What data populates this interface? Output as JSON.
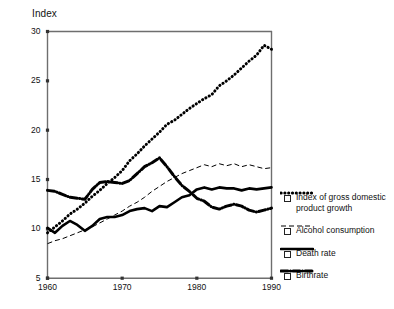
{
  "chart_data": {
    "type": "line",
    "title": "",
    "ylabel": "Index",
    "xlabel": "",
    "ylim": [
      5,
      30
    ],
    "xlim": [
      1960,
      1990
    ],
    "grid": false,
    "legend_position": "right-outside",
    "yticks": [
      5,
      10,
      15,
      20,
      25,
      30
    ],
    "xticks": [
      1960,
      1970,
      1980,
      1990
    ],
    "x": [
      1960,
      1961,
      1962,
      1963,
      1964,
      1965,
      1966,
      1967,
      1968,
      1969,
      1970,
      1971,
      1972,
      1973,
      1974,
      1975,
      1976,
      1977,
      1978,
      1979,
      1980,
      1981,
      1982,
      1983,
      1984,
      1985,
      1986,
      1987,
      1988,
      1989,
      1990
    ],
    "series": [
      {
        "name": "Index of gross domestic product growth",
        "style": "dotted",
        "values": [
          9.6,
          10.2,
          10.8,
          11.5,
          12.0,
          12.6,
          13.3,
          13.9,
          14.6,
          15.2,
          15.9,
          16.9,
          17.6,
          18.4,
          19.1,
          19.8,
          20.6,
          21.0,
          21.6,
          22.2,
          22.7,
          23.2,
          23.6,
          24.5,
          25.0,
          25.6,
          26.3,
          27.0,
          27.6,
          28.6,
          28.2
        ]
      },
      {
        "name": "Alcohol consumption",
        "style": "dashed",
        "values": [
          8.5,
          8.8,
          9.0,
          9.3,
          9.6,
          9.9,
          10.2,
          10.6,
          11.0,
          11.4,
          11.8,
          12.3,
          12.7,
          13.2,
          13.8,
          14.3,
          14.8,
          15.2,
          15.6,
          15.9,
          16.2,
          16.5,
          16.3,
          16.6,
          16.4,
          16.6,
          16.3,
          16.5,
          16.3,
          16.1,
          16.2
        ]
      },
      {
        "name": "Death rate",
        "style": "solid",
        "values": [
          10.1,
          9.6,
          10.3,
          10.8,
          10.4,
          9.8,
          10.3,
          11.0,
          11.2,
          11.2,
          11.4,
          11.8,
          12.0,
          12.1,
          11.8,
          12.3,
          12.2,
          12.7,
          13.2,
          13.4,
          14.0,
          14.2,
          14.0,
          14.2,
          14.1,
          14.1,
          13.9,
          14.1,
          14.0,
          14.1,
          14.2
        ]
      },
      {
        "name": "Birthrate",
        "style": "dash-dot",
        "values": [
          13.9,
          13.8,
          13.5,
          13.2,
          13.1,
          13.0,
          14.0,
          14.7,
          14.8,
          14.7,
          14.6,
          14.9,
          15.6,
          16.3,
          16.7,
          17.2,
          16.3,
          15.3,
          14.4,
          13.8,
          13.1,
          12.8,
          12.2,
          12.0,
          12.3,
          12.5,
          12.3,
          11.9,
          11.7,
          11.9,
          12.1
        ]
      }
    ]
  },
  "legend": {
    "items": [
      {
        "label": "Index of gross domestic product growth",
        "style": "dotted"
      },
      {
        "label": "Alcohol consumption",
        "style": "dashed"
      },
      {
        "label": "Death rate",
        "style": "solid"
      },
      {
        "label": "Birthrate",
        "style": "dash-dot"
      }
    ]
  }
}
